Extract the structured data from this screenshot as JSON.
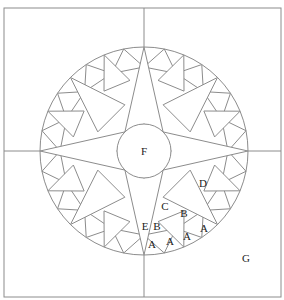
{
  "diagram": {
    "colors": {
      "line": "#8c8c8c",
      "background": "#ffffff",
      "text": "#222222"
    },
    "frame": {
      "x": 4,
      "y": 8,
      "width": 277,
      "height": 289
    },
    "center": {
      "x": 144,
      "y": 151
    },
    "outer_radius": 104,
    "inner_radius": 27,
    "points_count": 32,
    "labels": [
      {
        "id": "F",
        "text": "F",
        "x": 144,
        "y": 155
      },
      {
        "id": "E",
        "text": "E",
        "x": 145,
        "y": 230
      },
      {
        "id": "D",
        "text": "D",
        "x": 203,
        "y": 187
      },
      {
        "id": "C",
        "text": "C",
        "x": 165,
        "y": 210
      },
      {
        "id": "B1",
        "text": "B",
        "x": 157,
        "y": 230
      },
      {
        "id": "B2",
        "text": "B",
        "x": 184,
        "y": 217
      },
      {
        "id": "A1",
        "text": "A",
        "x": 152,
        "y": 248
      },
      {
        "id": "A2",
        "text": "A",
        "x": 170,
        "y": 245
      },
      {
        "id": "A3",
        "text": "A",
        "x": 187,
        "y": 240
      },
      {
        "id": "A4",
        "text": "A",
        "x": 204,
        "y": 232
      },
      {
        "id": "G",
        "text": "G",
        "x": 246,
        "y": 262
      }
    ]
  }
}
